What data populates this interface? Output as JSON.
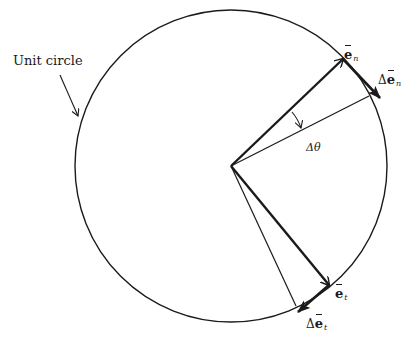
{
  "diagram": {
    "colors": {
      "stroke": "#1a1a1a",
      "background": "#ffffff"
    },
    "geometry": {
      "center": [
        231,
        166
      ],
      "radius": 156,
      "e_n_tip": [
        343,
        59
      ],
      "e_n_rotated_tip": [
        369,
        96
      ],
      "e_t_tip": [
        329,
        285
      ],
      "e_t_rotated_tip": [
        296,
        306
      ],
      "delta_e_n_tip": [
        380,
        98
      ],
      "delta_e_t_tip": [
        298,
        312
      ]
    },
    "labels": {
      "unit_circle": "Unit circle",
      "e_n": {
        "symbol": "e",
        "subscript": "n"
      },
      "delta_e_n": {
        "delta": "Δ",
        "symbol": "e",
        "subscript": "n"
      },
      "e_t": {
        "symbol": "e",
        "subscript": "t"
      },
      "delta_e_t": {
        "delta": "Δ",
        "symbol": "e",
        "subscript": "t"
      },
      "delta_theta": {
        "delta": "Δ",
        "symbol": "θ"
      }
    }
  }
}
